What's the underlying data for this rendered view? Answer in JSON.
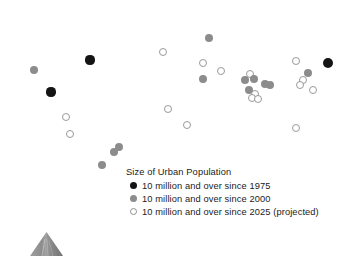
{
  "figure": {
    "type": "world-map-thematic",
    "background_color": "#ffffff",
    "land_color": "#e2e2e2",
    "land_hatch_color": "#d2d2d2"
  },
  "legend": {
    "title": "Size of Urban Population",
    "items": [
      {
        "label": "10 million and over since 1975",
        "marker": "filled-black-circle",
        "color": "#141414",
        "class": "sw-1975"
      },
      {
        "label": "10 million and over since 2000",
        "marker": "filled-gray-circle",
        "color": "#8c8c8c",
        "class": "sw-2000"
      },
      {
        "label": "10 million and over since 2025 (projected)",
        "marker": "open-circle",
        "color": "#ffffff",
        "class": "sw-2025"
      }
    ]
  },
  "markers": [
    {
      "name": "city-marker-new-york",
      "category": "since1975",
      "x": 90,
      "y": 60,
      "r": 4.6
    },
    {
      "name": "city-marker-los-angeles",
      "category": "since2000",
      "x": 34,
      "y": 70,
      "r": 4.2
    },
    {
      "name": "city-marker-mexico-city",
      "category": "since1975",
      "x": 51,
      "y": 92,
      "r": 4.6
    },
    {
      "name": "city-marker-bogota",
      "category": "since2025",
      "x": 66,
      "y": 117,
      "r": 4.2
    },
    {
      "name": "city-marker-lima",
      "category": "since2025",
      "x": 70,
      "y": 134,
      "r": 4.2
    },
    {
      "name": "city-marker-rio-de-janeiro",
      "category": "since2000",
      "x": 119,
      "y": 147,
      "r": 4.2
    },
    {
      "name": "city-marker-sao-paulo",
      "category": "since2000",
      "x": 114,
      "y": 152,
      "r": 4.4
    },
    {
      "name": "city-marker-buenos-aires",
      "category": "since2000",
      "x": 102,
      "y": 165,
      "r": 4.4
    },
    {
      "name": "city-marker-moscow",
      "category": "since2000",
      "x": 209,
      "y": 38,
      "r": 4.4
    },
    {
      "name": "city-marker-london",
      "category": "since2025",
      "x": 163,
      "y": 52,
      "r": 4.2
    },
    {
      "name": "city-marker-istanbul",
      "category": "since2025",
      "x": 203,
      "y": 63,
      "r": 4.2
    },
    {
      "name": "city-marker-cairo",
      "category": "since2000",
      "x": 203,
      "y": 79,
      "r": 4.4
    },
    {
      "name": "city-marker-lagos",
      "category": "since2025",
      "x": 168,
      "y": 109,
      "r": 4.4
    },
    {
      "name": "city-marker-kinshasa",
      "category": "since2025",
      "x": 187,
      "y": 125,
      "r": 4.4
    },
    {
      "name": "city-marker-tehran",
      "category": "since2025",
      "x": 221,
      "y": 71,
      "r": 4.2
    },
    {
      "name": "city-marker-karachi",
      "category": "since2000",
      "x": 245,
      "y": 80,
      "r": 4.4
    },
    {
      "name": "city-marker-lahore",
      "category": "since2025",
      "x": 250,
      "y": 74,
      "r": 4.2
    },
    {
      "name": "city-marker-delhi",
      "category": "since2000",
      "x": 254,
      "y": 79,
      "r": 4.4
    },
    {
      "name": "city-marker-mumbai",
      "category": "since2000",
      "x": 249,
      "y": 90,
      "r": 4.4
    },
    {
      "name": "city-marker-hyderabad",
      "category": "since2025",
      "x": 255,
      "y": 94,
      "r": 4.2
    },
    {
      "name": "city-marker-bangalore",
      "category": "since2025",
      "x": 252,
      "y": 98,
      "r": 4.2
    },
    {
      "name": "city-marker-chennai",
      "category": "since2025",
      "x": 258,
      "y": 99,
      "r": 4.2
    },
    {
      "name": "city-marker-kolkata",
      "category": "since2000",
      "x": 265,
      "y": 84,
      "r": 4.4
    },
    {
      "name": "city-marker-dhaka",
      "category": "since2000",
      "x": 270,
      "y": 85,
      "r": 4.4
    },
    {
      "name": "city-marker-beijing",
      "category": "since2025",
      "x": 296,
      "y": 61,
      "r": 4.4
    },
    {
      "name": "city-marker-tokyo",
      "category": "since1975",
      "x": 328,
      "y": 63,
      "r": 5.0
    },
    {
      "name": "city-marker-seoul",
      "category": "since2000",
      "x": 308,
      "y": 73,
      "r": 4.4
    },
    {
      "name": "city-marker-shanghai",
      "category": "since2025",
      "x": 303,
      "y": 80,
      "r": 4.4
    },
    {
      "name": "city-marker-guangzhou",
      "category": "since2025",
      "x": 300,
      "y": 85,
      "r": 4.4
    },
    {
      "name": "city-marker-manila",
      "category": "since2025",
      "x": 313,
      "y": 90,
      "r": 4.2
    },
    {
      "name": "city-marker-jakarta",
      "category": "since2025",
      "x": 296,
      "y": 128,
      "r": 4.4
    }
  ]
}
